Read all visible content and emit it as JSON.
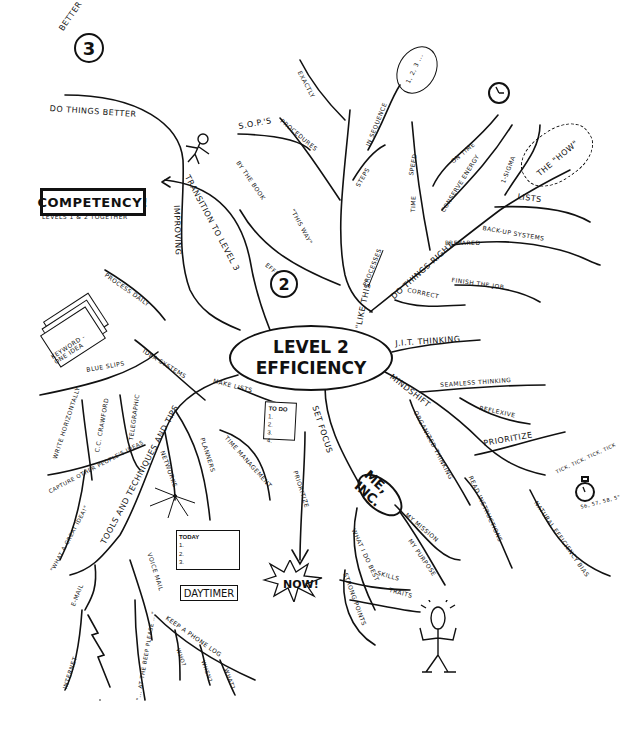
{
  "center": {
    "line1": "LEVEL 2",
    "line2": "EFFICIENCY"
  },
  "level3": {
    "badge_label": "BETTER",
    "badge_number": "3",
    "branch": "DO THINGS BETTER"
  },
  "level2_badge": {
    "label": "EFFICIENCY",
    "number": "2"
  },
  "competency": {
    "title": "COMPETENCY!",
    "subtitle": "LEVELS 1 & 2 TOGETHER"
  },
  "transition": {
    "main": "TRANSITION TO LEVEL 3",
    "sub": "IMPROVING"
  },
  "like_this": {
    "main": "\"LIKE THIS\"",
    "processes": "PROCESSES",
    "steps": "STEPS",
    "in_sequence": "IN SEQUENCE",
    "sequence_bubble": "1, 2, 3 ...",
    "exactly": "EXACTLY",
    "procedures": "PROCEDURES",
    "sops": "S.O.P.'s",
    "by_the_book": "BY THE BOOK",
    "this_way": "\"THIS WAY\""
  },
  "do_things_right": {
    "main": "DO THINGS RIGHT",
    "time": "TIME",
    "speed": "SPEED",
    "on_time": "ON TIME",
    "conserve_energy": "CONSERVE ENERGY",
    "one_sigma": "1-SIGMA",
    "the_how": "THE \"HOW\"",
    "lists": "LISTS",
    "prepared": "PREPARED",
    "backup_systems": "BACK-UP SYSTEMS",
    "correct": "CORRECT",
    "finish_the_job": "FINISH THE JOB"
  },
  "right_branches": {
    "jit_thinking": "J.I.T. THINKING",
    "mindshift": "MINDSHIFT",
    "seamless_thinking": "SEAMLESS THINKING",
    "reflexive": "REFLEXIVE",
    "prioritize": "PRIORITIZE",
    "organized_thinking": "ORGANIZED THINKING",
    "read_instructions": "READ INSTRUCTIONS",
    "natural_efficiency_bias": "NATURAL EFFICIENCY BIAS",
    "tick_text": "TICK, TICK, TICK, TICK",
    "countdown_text": "56, 57, 58, 5\""
  },
  "set_focus": {
    "main": "SET FOCUS",
    "me_inc": "ME, INC.",
    "my_mission": "MY MISSION",
    "my_purpose": "MY PURPOSE",
    "what_i_do_best": "WHAT I DO BEST",
    "skills": "SKILLS",
    "traits": "TRAITS",
    "strong_points": "STRONG POINTS"
  },
  "lists_branch": {
    "make_lists": "MAKE LISTS",
    "todo_title": "TO DO",
    "todo_items": [
      "1.",
      "2.",
      "3.",
      "4."
    ],
    "time_management": "TIME MANAGEMENT",
    "prioritize": "PRIORITIZE",
    "now": "NOW!"
  },
  "tools": {
    "main": "TOOLS AND TECHNIQUES AND TIPS",
    "idea_systems": "IDEA SYSTEMS",
    "process_daily": "PROCESS DAILY",
    "blue_slips": "BLUE SLIPS",
    "keyword_card": "KEYWORD - ONE IDEA",
    "write_horizontally": "WRITE HORIZONTALLY",
    "cc_crawford": "C.C. CRAWFORD",
    "telegraphic": "TELEGRAPHIC",
    "capture_ideas": "CAPTURE OTHER PEOPLE'S IDEAS",
    "what_a_great_idea": "\"WHAT A GREAT IDEA!\"",
    "networks": "NETWORKS",
    "planners": "PLANNERS",
    "daytimer": "DAYTIMER",
    "today": "TODAY",
    "today_items": [
      "1.",
      "2.",
      "3."
    ],
    "email": "E-MAIL",
    "internet": "INTERNET",
    "voice_mail": "VOICE MAIL",
    "at_the_beep": "\"... AT THE BEEP PLEASE ...\"",
    "phone_log": "KEEP A PHONE LOG",
    "who": "WHO?",
    "when": "WHEN?",
    "what": "WHAT?"
  }
}
